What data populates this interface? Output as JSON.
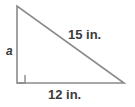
{
  "figure": {
    "name": "right-triangle-diagram",
    "type": "geometry-figure",
    "width": 135,
    "height": 107,
    "background_color": "#ffffff",
    "stroke_color": "#8a8a8a",
    "text_color": "#3b3b3b"
  },
  "labels": {
    "leg_a": "a",
    "hypotenuse": "15 in.",
    "base": "12 in."
  },
  "geometry": {
    "vertices": {
      "top": {
        "x": 17,
        "y": 6
      },
      "bottom_left": {
        "x": 17,
        "y": 83
      },
      "bottom_right": {
        "x": 124,
        "y": 83
      }
    },
    "right_angle_marker": {
      "corner": "bottom-left",
      "size": 8
    },
    "sides": [
      {
        "name": "vertical-leg",
        "label": "a"
      },
      {
        "name": "horizontal-leg",
        "label": "12 in."
      },
      {
        "name": "hypotenuse",
        "label": "15 in."
      }
    ]
  }
}
